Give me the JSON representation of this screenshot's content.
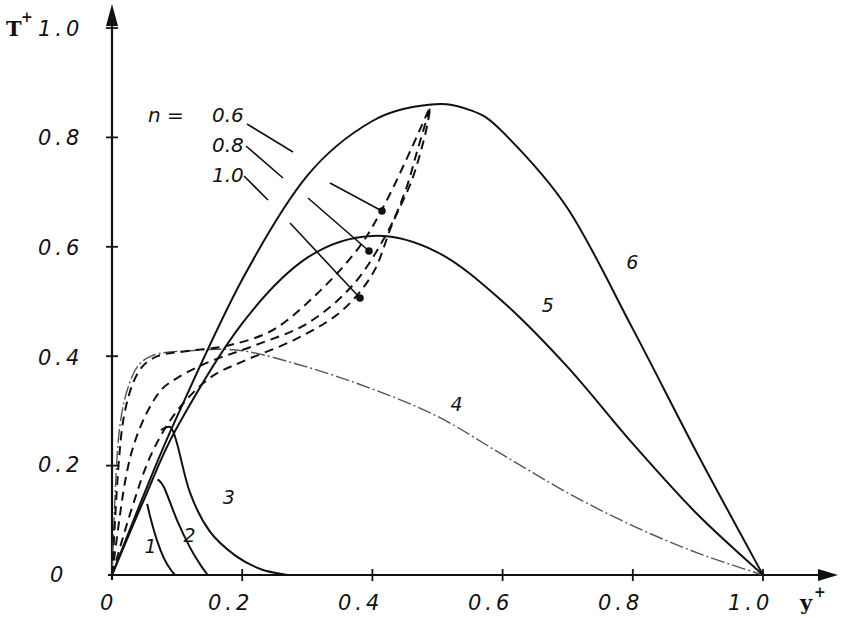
{
  "chart_data": {
    "type": "line",
    "title": "",
    "xlabel": "y+",
    "ylabel": "T+",
    "xlim": [
      0,
      1.0
    ],
    "ylim": [
      0,
      1.0
    ],
    "grid": false,
    "x_ticks": [
      "0",
      "0.2",
      "0.4",
      "0.6",
      "0.8",
      "1.0"
    ],
    "y_ticks": [
      "0",
      "0.2",
      "0.4",
      "0.6",
      "0.8",
      "1.0"
    ],
    "legend": {
      "title": "n =",
      "entries": [
        "0.6",
        "0.8",
        "1.0"
      ],
      "style": "dashed",
      "position": "upper-left, with leader lines pointing to dashed curves"
    },
    "series": [
      {
        "name": "1",
        "style": "solid",
        "x": [
          0.054,
          0.06,
          0.07,
          0.08,
          0.09,
          0.097
        ],
        "y": [
          0.13,
          0.1,
          0.06,
          0.03,
          0.01,
          0.0
        ]
      },
      {
        "name": "2",
        "style": "solid",
        "x": [
          0.07,
          0.08,
          0.1,
          0.12,
          0.135,
          0.147
        ],
        "y": [
          0.175,
          0.16,
          0.1,
          0.05,
          0.02,
          0.0
        ]
      },
      {
        "name": "3",
        "style": "solid",
        "x": [
          0.075,
          0.09,
          0.1,
          0.12,
          0.15,
          0.19,
          0.23,
          0.27
        ],
        "y": [
          0.265,
          0.27,
          0.24,
          0.15,
          0.08,
          0.035,
          0.01,
          0.0
        ]
      },
      {
        "name": "4",
        "style": "dotted-faint",
        "x": [
          0.0,
          0.01,
          0.03,
          0.06,
          0.12,
          0.2,
          0.3,
          0.4,
          0.5,
          0.6,
          0.7,
          0.8,
          0.9,
          1.0
        ],
        "y": [
          0.0,
          0.25,
          0.36,
          0.4,
          0.41,
          0.41,
          0.38,
          0.34,
          0.29,
          0.22,
          0.15,
          0.09,
          0.04,
          0.0
        ]
      },
      {
        "name": "5",
        "style": "solid",
        "x": [
          0.0,
          0.05,
          0.1,
          0.2,
          0.3,
          0.4,
          0.5,
          0.6,
          0.7,
          0.8,
          0.9,
          1.0
        ],
        "y": [
          0.0,
          0.14,
          0.27,
          0.46,
          0.58,
          0.62,
          0.59,
          0.5,
          0.38,
          0.24,
          0.11,
          0.0
        ]
      },
      {
        "name": "6",
        "style": "solid",
        "x": [
          0.0,
          0.05,
          0.1,
          0.2,
          0.3,
          0.4,
          0.49,
          0.55,
          0.6,
          0.7,
          0.8,
          0.9,
          1.0
        ],
        "y": [
          0.0,
          0.15,
          0.29,
          0.54,
          0.73,
          0.83,
          0.86,
          0.85,
          0.81,
          0.67,
          0.45,
          0.22,
          0.0
        ]
      },
      {
        "name": "n = 0.6",
        "style": "dashed",
        "x": [
          0.0,
          0.01,
          0.02,
          0.04,
          0.07,
          0.12,
          0.18,
          0.25,
          0.32,
          0.38,
          0.42,
          0.46,
          0.49
        ],
        "y": [
          0.0,
          0.2,
          0.3,
          0.37,
          0.4,
          0.41,
          0.42,
          0.45,
          0.52,
          0.6,
          0.68,
          0.78,
          0.86
        ]
      },
      {
        "name": "n = 0.8",
        "style": "dashed",
        "x": [
          0.0,
          0.02,
          0.04,
          0.07,
          0.1,
          0.15,
          0.22,
          0.3,
          0.37,
          0.42,
          0.45,
          0.47,
          0.49
        ],
        "y": [
          0.0,
          0.17,
          0.26,
          0.33,
          0.36,
          0.39,
          0.42,
          0.46,
          0.53,
          0.62,
          0.7,
          0.78,
          0.86
        ]
      },
      {
        "name": "n = 1.0",
        "style": "dashed",
        "x": [
          0.0,
          0.03,
          0.06,
          0.1,
          0.15,
          0.2,
          0.28,
          0.35,
          0.4,
          0.43,
          0.46,
          0.48,
          0.49
        ],
        "y": [
          0.0,
          0.12,
          0.22,
          0.3,
          0.36,
          0.39,
          0.43,
          0.48,
          0.55,
          0.64,
          0.72,
          0.8,
          0.86
        ]
      }
    ],
    "curve_labels": [
      {
        "text": "1",
        "x": 0.05,
        "y": 0.04
      },
      {
        "text": "2",
        "x": 0.11,
        "y": 0.06
      },
      {
        "text": "3",
        "x": 0.17,
        "y": 0.13
      },
      {
        "text": "4",
        "x": 0.52,
        "y": 0.3
      },
      {
        "text": "5",
        "x": 0.66,
        "y": 0.48
      },
      {
        "text": "6",
        "x": 0.79,
        "y": 0.56
      }
    ]
  },
  "axes": {
    "y_title": "T",
    "y_title_sup": "+",
    "x_title": "y",
    "x_title_sup": "+",
    "x_tick_labels": [
      "0",
      "0.2",
      "0.4",
      "0.6",
      "0.8",
      "1.0"
    ],
    "y_tick_labels": [
      "0",
      "0.2",
      "0.4",
      "0.6",
      "0.8",
      "1.0"
    ]
  },
  "legend": {
    "prefix": "n  =",
    "entries": [
      "0.6",
      "0.8",
      "1.0"
    ]
  },
  "colors": {
    "ink": "#111111",
    "faint": "#555555",
    "background": "#ffffff"
  }
}
